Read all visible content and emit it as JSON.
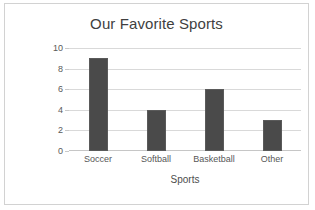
{
  "chart_data": {
    "type": "bar",
    "title": "Our Favorite Sports",
    "xlabel": "Sports",
    "ylabel": "Number of Students",
    "categories": [
      "Soccer",
      "Softball",
      "Basketball",
      "Other"
    ],
    "values": [
      9,
      4,
      6,
      3
    ],
    "ylim": [
      0,
      10
    ],
    "yticks": [
      0,
      2,
      4,
      6,
      8,
      10
    ],
    "grid": "horizontal",
    "legend": "none",
    "bar_color": "#4a4a4a",
    "gridline_color": "#d9d9d9",
    "title_color": "#3f3f3f",
    "border_color": "#d2d2d2",
    "background_color": "#ffffff"
  }
}
